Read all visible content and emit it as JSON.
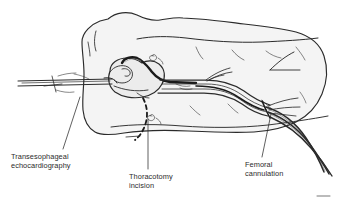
{
  "figure": {
    "style": "black-and-white line drawing",
    "background_color": "#ffffff",
    "line_color": "#2b2b2b",
    "fill_color": "#f2f2f2",
    "text_color": "#2b2b2b"
  },
  "labels": {
    "tee": "Transesophageal\nechocardiography",
    "thoracotomy": "Thoracotomy\nincision",
    "femoral": "Femoral\ncannulation"
  },
  "parts": {
    "torso": "supine-patient-torso",
    "heart": "heart",
    "aortic_cannula": "aortic-cannula",
    "tee_probe": "transesophageal-echo-probe",
    "incision": "thoracotomy-incision-dashed",
    "vessels": "femoral-vessels",
    "tubing": "femoral-cannula-tubing"
  }
}
